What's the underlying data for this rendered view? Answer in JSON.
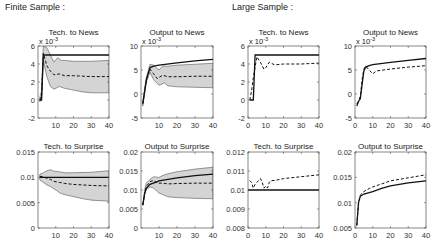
{
  "sections": {
    "finite": "Finite Sample :",
    "large": "Large Sample :"
  },
  "chart_data": [
    {
      "id": "finite-tech-news",
      "type": "line",
      "title": "Tech. to News",
      "multiplier": "x 10^-3",
      "box": [
        38,
        46,
        109,
        118
      ],
      "xlim": [
        0,
        40
      ],
      "ylim": [
        -2,
        6
      ],
      "yticks": [
        -2,
        0,
        2,
        4,
        6
      ],
      "ytick_labels": [
        "-2",
        "0",
        "2",
        "4",
        "6"
      ],
      "xticks": [
        10,
        20,
        30,
        40
      ],
      "xtick_labels": [
        "10",
        "20",
        "30",
        "40"
      ],
      "series": [
        {
          "name": "true",
          "style": "solid",
          "x": [
            1,
            2,
            3,
            40
          ],
          "y": [
            0,
            0,
            5,
            5
          ]
        },
        {
          "name": "median",
          "style": "dashed",
          "x": [
            1,
            2,
            3,
            5,
            7,
            9,
            12,
            15,
            20,
            30,
            40
          ],
          "y": [
            0,
            0.5,
            5.2,
            3.8,
            3.2,
            2.8,
            2.9,
            2.7,
            2.7,
            2.6,
            2.6
          ]
        },
        {
          "name": "band_upper",
          "style": "band",
          "x": [
            1,
            2,
            3,
            5,
            7,
            9,
            11,
            13,
            15,
            20,
            30,
            40
          ],
          "y": [
            0.3,
            1.0,
            6.0,
            5.8,
            5.0,
            4.2,
            4.7,
            4.4,
            4.4,
            4.3,
            4.3,
            4.4
          ]
        },
        {
          "name": "band_lower",
          "style": "band",
          "x": [
            1,
            2,
            3,
            5,
            7,
            9,
            12,
            15,
            20,
            25,
            30,
            40
          ],
          "y": [
            -0.2,
            0,
            4.4,
            2.6,
            1.5,
            1.2,
            1.5,
            1.3,
            1.1,
            0.9,
            0.8,
            0.8
          ]
        }
      ]
    },
    {
      "id": "finite-output-news",
      "type": "line",
      "title": "Output to News",
      "multiplier": "x 10^-3",
      "box": [
        141,
        46,
        213,
        118
      ],
      "xlim": [
        0,
        40
      ],
      "ylim": [
        -5,
        10
      ],
      "yticks": [
        -5,
        0,
        5,
        10
      ],
      "ytick_labels": [
        "-5",
        "0",
        "5",
        "10"
      ],
      "xticks": [
        10,
        20,
        30,
        40
      ],
      "xtick_labels": [
        "10",
        "20",
        "30",
        "40"
      ],
      "series": [
        {
          "name": "true",
          "style": "solid",
          "x": [
            1,
            3,
            5,
            7,
            10,
            20,
            30,
            40
          ],
          "y": [
            -2,
            3,
            5.5,
            5.8,
            6,
            6.5,
            6.9,
            7.2
          ]
        },
        {
          "name": "median",
          "style": "dashed",
          "x": [
            1,
            3,
            5,
            7,
            9,
            12,
            15,
            20,
            30,
            40
          ],
          "y": [
            -2,
            3,
            5.2,
            4.2,
            3.2,
            3.9,
            3.6,
            3.6,
            3.7,
            3.7
          ]
        },
        {
          "name": "band_upper",
          "style": "band",
          "x": [
            1,
            3,
            5,
            7,
            10,
            12,
            15,
            20,
            30,
            40
          ],
          "y": [
            -1.5,
            3.5,
            6.2,
            6.0,
            5.0,
            5.8,
            5.8,
            6.0,
            6.2,
            6.4
          ]
        },
        {
          "name": "band_lower",
          "style": "band",
          "x": [
            1,
            3,
            5,
            7,
            10,
            13,
            15,
            20,
            30,
            40
          ],
          "y": [
            -2.5,
            2.5,
            4.5,
            3.0,
            1.8,
            2.3,
            1.7,
            1.5,
            1.4,
            1.3
          ]
        }
      ]
    },
    {
      "id": "large-tech-news",
      "type": "line",
      "title": "Tech. to News",
      "multiplier": "x 10^-3",
      "box": [
        248,
        46,
        319,
        118
      ],
      "xlim": [
        0,
        40
      ],
      "ylim": [
        -2,
        6
      ],
      "yticks": [
        -2,
        0,
        2,
        4,
        6
      ],
      "ytick_labels": [
        "-2",
        "0",
        "2",
        "4",
        "6"
      ],
      "xticks": [
        0,
        10,
        20,
        30,
        40
      ],
      "xtick_labels": [
        "0",
        "10",
        "20",
        "30",
        "40"
      ],
      "series": [
        {
          "name": "true",
          "style": "solid",
          "x": [
            1,
            3,
            4,
            40
          ],
          "y": [
            0,
            0,
            5,
            5
          ]
        },
        {
          "name": "estimate",
          "style": "dashed",
          "x": [
            1,
            2,
            3,
            5,
            7,
            9,
            10,
            12,
            15,
            20,
            30,
            40
          ],
          "y": [
            0,
            1,
            2.5,
            4.8,
            4.2,
            3.4,
            3.6,
            4.2,
            3.9,
            4.0,
            4.0,
            4.1
          ]
        }
      ]
    },
    {
      "id": "large-output-news",
      "type": "line",
      "title": "Output to News",
      "multiplier": "x 10^-3",
      "box": [
        355,
        46,
        426,
        118
      ],
      "xlim": [
        0,
        40
      ],
      "ylim": [
        -5,
        10
      ],
      "yticks": [
        -5,
        0,
        5,
        10
      ],
      "ytick_labels": [
        "-5",
        "0",
        "5",
        "10"
      ],
      "xticks": [
        0,
        10,
        20,
        30,
        40
      ],
      "xtick_labels": [
        "0",
        "10",
        "20",
        "30",
        "40"
      ],
      "series": [
        {
          "name": "true",
          "style": "solid",
          "x": [
            1,
            2,
            3,
            4,
            5,
            6,
            8,
            10,
            20,
            30,
            40
          ],
          "y": [
            -2.5,
            -1.5,
            -1,
            2,
            4.8,
            5.6,
            5.9,
            6.1,
            6.6,
            7.0,
            7.4
          ]
        },
        {
          "name": "estimate",
          "style": "dashed",
          "x": [
            1,
            2,
            3,
            4,
            5,
            6,
            8,
            10,
            12,
            20,
            30,
            40
          ],
          "y": [
            -2,
            -1.5,
            -0.5,
            3,
            5.2,
            5.8,
            5.0,
            4.2,
            4.8,
            5.2,
            5.6,
            5.9
          ]
        }
      ]
    },
    {
      "id": "finite-tech-surprise",
      "type": "line",
      "title": "Tech. to Surprise",
      "box": [
        38,
        152,
        109,
        228
      ],
      "xlim": [
        0,
        40
      ],
      "ylim": [
        0,
        0.015
      ],
      "yticks": [
        0,
        0.005,
        0.01,
        0.015
      ],
      "ytick_labels": [
        "0",
        "0.005",
        "0.01",
        "0.015"
      ],
      "xticks": [
        10,
        20,
        30,
        40
      ],
      "xtick_labels": [
        "10",
        "20",
        "30",
        "40"
      ],
      "series": [
        {
          "name": "true",
          "style": "solid",
          "x": [
            1,
            40
          ],
          "y": [
            0.01,
            0.01
          ]
        },
        {
          "name": "median",
          "style": "dashed",
          "x": [
            1,
            3,
            5,
            7,
            9,
            12,
            15,
            20,
            30,
            40
          ],
          "y": [
            0.0102,
            0.0101,
            0.0098,
            0.0096,
            0.0092,
            0.009,
            0.0088,
            0.0086,
            0.0084,
            0.0083
          ]
        },
        {
          "name": "band_upper",
          "style": "band",
          "x": [
            1,
            3,
            5,
            7,
            9,
            12,
            15,
            20,
            30,
            40
          ],
          "y": [
            0.0106,
            0.0109,
            0.0113,
            0.0115,
            0.0112,
            0.0111,
            0.0109,
            0.0109,
            0.011,
            0.0113
          ]
        },
        {
          "name": "band_lower",
          "style": "band",
          "x": [
            1,
            3,
            5,
            7,
            10,
            13,
            16,
            20,
            25,
            30,
            40
          ],
          "y": [
            0.0095,
            0.009,
            0.0085,
            0.0082,
            0.0075,
            0.0068,
            0.0065,
            0.0062,
            0.0058,
            0.0055,
            0.0053
          ]
        }
      ]
    },
    {
      "id": "finite-output-surprise",
      "type": "line",
      "title": "Output to Surprise",
      "box": [
        141,
        152,
        213,
        228
      ],
      "xlim": [
        0,
        40
      ],
      "ylim": [
        0,
        0.02
      ],
      "yticks": [
        0,
        0.005,
        0.01,
        0.015,
        0.02
      ],
      "ytick_labels": [
        "0",
        "0.005",
        "0.01",
        "0.015",
        "0.02"
      ],
      "xticks": [
        10,
        20,
        30,
        40
      ],
      "xtick_labels": [
        "10",
        "20",
        "30",
        "40"
      ],
      "series": [
        {
          "name": "true",
          "style": "solid",
          "x": [
            1,
            2,
            3,
            5,
            8,
            10,
            15,
            20,
            30,
            40
          ],
          "y": [
            0.006,
            0.009,
            0.0105,
            0.0115,
            0.012,
            0.0124,
            0.0128,
            0.0132,
            0.0138,
            0.0142
          ]
        },
        {
          "name": "median",
          "style": "dashed",
          "x": [
            1,
            2,
            3,
            5,
            7,
            9,
            12,
            15,
            20,
            30,
            40
          ],
          "y": [
            0.006,
            0.009,
            0.011,
            0.0122,
            0.0125,
            0.0118,
            0.0118,
            0.0116,
            0.0117,
            0.0118,
            0.0118
          ]
        },
        {
          "name": "band_upper",
          "style": "band",
          "x": [
            1,
            2,
            3,
            5,
            7,
            10,
            12,
            15,
            20,
            30,
            40
          ],
          "y": [
            0.006,
            0.01,
            0.0118,
            0.0128,
            0.0135,
            0.0133,
            0.0138,
            0.0143,
            0.0148,
            0.0155,
            0.016
          ]
        },
        {
          "name": "band_lower",
          "style": "band",
          "x": [
            1,
            2,
            3,
            5,
            7,
            10,
            12,
            15,
            20,
            30,
            40
          ],
          "y": [
            0.006,
            0.009,
            0.0102,
            0.0108,
            0.0105,
            0.0092,
            0.0088,
            0.0082,
            0.008,
            0.0078,
            0.0077
          ]
        }
      ]
    },
    {
      "id": "large-tech-surprise",
      "type": "line",
      "title": "Tech. to Surprise",
      "box": [
        248,
        152,
        319,
        228
      ],
      "xlim": [
        0,
        40
      ],
      "ylim": [
        0.008,
        0.012
      ],
      "yticks": [
        0.008,
        0.009,
        0.01,
        0.011,
        0.012
      ],
      "ytick_labels": [
        "0.008",
        "0.009",
        "0.01",
        "0.011",
        "0.012"
      ],
      "xticks": [
        0,
        10,
        20,
        30,
        40
      ],
      "xtick_labels": [
        "0",
        "10",
        "20",
        "30",
        "40"
      ],
      "series": [
        {
          "name": "true",
          "style": "solid",
          "x": [
            0,
            40
          ],
          "y": [
            0.01,
            0.01
          ]
        },
        {
          "name": "estimate",
          "style": "dashed",
          "x": [
            1,
            2,
            3,
            4,
            5,
            6,
            7,
            8,
            9,
            10,
            11,
            12,
            13,
            15,
            20,
            30,
            40
          ],
          "y": [
            0.0105,
            0.0104,
            0.0101,
            0.0103,
            0.0104,
            0.0105,
            0.0106,
            0.0104,
            0.0101,
            0.0102,
            0.0101,
            0.0104,
            0.0105,
            0.0105,
            0.0106,
            0.0107,
            0.0108
          ]
        }
      ]
    },
    {
      "id": "large-output-surprise",
      "type": "line",
      "title": "Output to Surprise",
      "box": [
        355,
        152,
        426,
        228
      ],
      "xlim": [
        0,
        40
      ],
      "ylim": [
        0.005,
        0.02
      ],
      "yticks": [
        0.005,
        0.01,
        0.015,
        0.02
      ],
      "ytick_labels": [
        "0.005",
        "0.01",
        "0.015",
        "0.02"
      ],
      "xticks": [
        0,
        10,
        20,
        30,
        40
      ],
      "xtick_labels": [
        "0",
        "10",
        "20",
        "30",
        "40"
      ],
      "series": [
        {
          "name": "true",
          "style": "solid",
          "x": [
            1,
            2,
            3,
            5,
            8,
            10,
            15,
            20,
            30,
            40
          ],
          "y": [
            0.0055,
            0.01,
            0.0113,
            0.0117,
            0.012,
            0.0122,
            0.0128,
            0.0133,
            0.0139,
            0.0143
          ]
        },
        {
          "name": "estimate",
          "style": "dashed",
          "x": [
            1,
            2,
            3,
            5,
            8,
            10,
            15,
            20,
            30,
            40
          ],
          "y": [
            0.0055,
            0.01,
            0.0115,
            0.0122,
            0.0128,
            0.0131,
            0.0137,
            0.0143,
            0.0149,
            0.0155
          ]
        }
      ]
    }
  ]
}
